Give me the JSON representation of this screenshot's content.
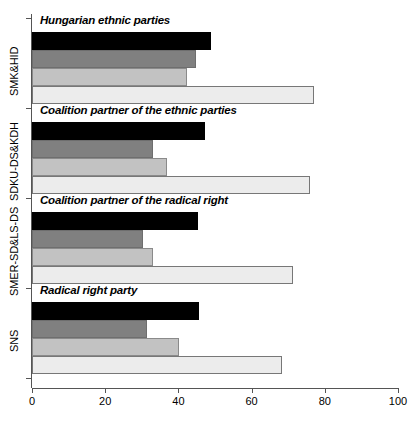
{
  "chart_data": {
    "type": "bar",
    "orientation": "horizontal",
    "title": "",
    "xlabel": "",
    "ylabel": "",
    "xlim": [
      0,
      100
    ],
    "xticks": [
      0,
      20,
      40,
      60,
      80,
      100
    ],
    "xtick_labels": [
      "0",
      "20",
      "40",
      "60",
      "80",
      "100"
    ],
    "grid": false,
    "legend": "none",
    "categories": [
      "SMK&HID",
      "SDKU-DS&KDH",
      "SMER-SD&LS-DS",
      "SNS"
    ],
    "group_annotations": [
      "Hungarian ethnic parties",
      "Coalition partner of the ethnic parties",
      "Coalition partner of the radical right",
      "Radical right party"
    ],
    "series": [
      {
        "name": "series-1",
        "color": "#000000",
        "values": [
          48.9,
          47.3,
          45.4,
          45.6
        ]
      },
      {
        "name": "series-2",
        "color": "#808080",
        "values": [
          44.8,
          33.1,
          30.3,
          31.4
        ]
      },
      {
        "name": "series-3",
        "color": "#c2c2c2",
        "values": [
          42.3,
          36.9,
          33.1,
          40.2
        ]
      },
      {
        "name": "series-4",
        "color": "#ececec",
        "values": [
          77.0,
          76.0,
          71.3,
          68.3
        ]
      }
    ]
  },
  "groups": [
    {
      "label": "SMK&HID",
      "annotation": "Hungarian ethnic parties",
      "bars": [
        {
          "value": 48.9,
          "tone": "black"
        },
        {
          "value": 44.8,
          "tone": "dark"
        },
        {
          "value": 42.3,
          "tone": "mid"
        },
        {
          "value": 77.0,
          "tone": "light"
        }
      ]
    },
    {
      "label": "SDKU-DS&KDH",
      "annotation": "Coalition partner of the ethnic parties",
      "bars": [
        {
          "value": 47.3,
          "tone": "black"
        },
        {
          "value": 33.1,
          "tone": "dark"
        },
        {
          "value": 36.9,
          "tone": "mid"
        },
        {
          "value": 76.0,
          "tone": "light"
        }
      ]
    },
    {
      "label": "SMER-SD&LS-DS",
      "annotation": "Coalition partner of the radical right",
      "bars": [
        {
          "value": 45.4,
          "tone": "black"
        },
        {
          "value": 30.3,
          "tone": "dark"
        },
        {
          "value": 33.1,
          "tone": "mid"
        },
        {
          "value": 71.3,
          "tone": "light"
        }
      ]
    },
    {
      "label": "SNS",
      "annotation": "Radical right party",
      "bars": [
        {
          "value": 45.6,
          "tone": "black"
        },
        {
          "value": 31.4,
          "tone": "dark"
        },
        {
          "value": 40.2,
          "tone": "mid"
        },
        {
          "value": 68.3,
          "tone": "light"
        }
      ]
    }
  ],
  "axis": {
    "ticks": [
      {
        "value": 0,
        "label": "0"
      },
      {
        "value": 20,
        "label": "20"
      },
      {
        "value": 40,
        "label": "40"
      },
      {
        "value": 60,
        "label": "60"
      },
      {
        "value": 80,
        "label": "80"
      },
      {
        "value": 100,
        "label": "100"
      }
    ]
  }
}
